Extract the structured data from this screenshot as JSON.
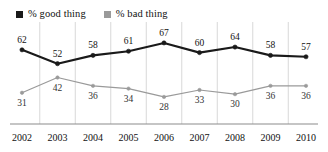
{
  "chart_data": {
    "type": "line",
    "title": "",
    "xlabel": "",
    "ylabel": "",
    "ylim": [
      20,
      72
    ],
    "grid": "vertical",
    "legend_position": "top-left",
    "categories": [
      "2002",
      "2003",
      "2004",
      "2005",
      "2006",
      "2007",
      "2008",
      "2009",
      "2010"
    ],
    "series": [
      {
        "name": "% good thing",
        "color": "#1a1a1a",
        "marker": "filled-dot",
        "values": [
          62,
          52,
          58,
          61,
          67,
          60,
          64,
          58,
          57
        ],
        "label_position": [
          "above",
          "above",
          "above",
          "above",
          "above",
          "above",
          "above",
          "above",
          "above"
        ]
      },
      {
        "name": "% bad thing",
        "color": "#9a9a9a",
        "marker": "filled-dot",
        "values": [
          31,
          42,
          36,
          34,
          28,
          33,
          30,
          36,
          36
        ],
        "label_position": [
          "below",
          "below",
          "below",
          "below",
          "below",
          "below",
          "below",
          "below",
          "below"
        ]
      }
    ]
  },
  "legend": {
    "items": [
      {
        "label": "% good thing",
        "color": "#1a1a1a"
      },
      {
        "label": "% bad thing",
        "color": "#9a9a9a"
      }
    ]
  },
  "axis": {
    "ticks": [
      "2002",
      "2003",
      "2004",
      "2005",
      "2006",
      "2007",
      "2008",
      "2009",
      "2010"
    ],
    "axis_line_color": "#8c8c8c",
    "gridline_color": "#d8d8d8"
  },
  "colors": {
    "good_series": "#1a1a1a",
    "bad_series": "#9a9a9a",
    "background": "#ffffff",
    "text": "#111111"
  }
}
